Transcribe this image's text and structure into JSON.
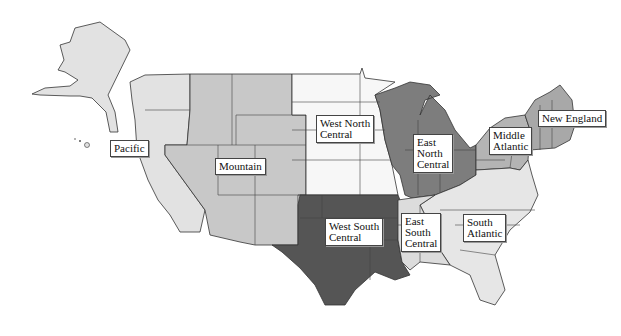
{
  "map": {
    "title": "",
    "regions": [
      {
        "id": "pacific",
        "label": "Pacific",
        "color": "#e2e2e2"
      },
      {
        "id": "mountain",
        "label": "Mountain",
        "color": "#c8c8c8"
      },
      {
        "id": "west-north-central",
        "label": "West North\nCentral",
        "color": "#f7f7f7"
      },
      {
        "id": "east-north-central",
        "label": "East\nNorth\nCentral",
        "color": "#7d7d7d"
      },
      {
        "id": "middle-atlantic",
        "label": "Middle\nAtlantic",
        "color": "#b4b4b4"
      },
      {
        "id": "new-england",
        "label": "New England",
        "color": "#a8a8a8"
      },
      {
        "id": "west-south-central",
        "label": "West South\nCentral",
        "color": "#555555"
      },
      {
        "id": "east-south-central",
        "label": "East\nSouth\nCentral",
        "color": "#dcdcdc"
      },
      {
        "id": "south-atlantic",
        "label": "South\nAtlantic",
        "color": "#e6e6e6"
      }
    ]
  }
}
